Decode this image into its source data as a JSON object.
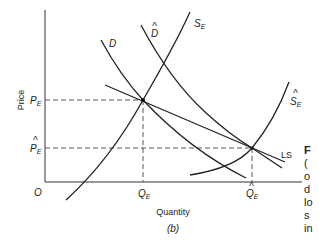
{
  "diagram": {
    "axes": {
      "ylabel": "Price",
      "xlabel": "Quantity",
      "origin": "O",
      "caption": "(b)"
    },
    "price_ticks": [
      {
        "label": "P",
        "sub": "E",
        "hat": false
      },
      {
        "label": "P",
        "sub": "E",
        "hat": true
      }
    ],
    "quantity_ticks": [
      {
        "label": "Q",
        "sub": "E",
        "hat": false
      },
      {
        "label": "Q",
        "sub": "E",
        "hat": true
      }
    ],
    "curves": {
      "demand": "D",
      "demand_shifted": "D",
      "supply": "S",
      "supply_sub": "E",
      "supply_shifted": "S",
      "supply_shifted_sub": "E",
      "long_run_supply": "LS"
    },
    "hat_glyph": "^",
    "side_text_fragments": [
      "F",
      "(",
      "o",
      "d",
      "lo",
      "s",
      "in"
    ]
  }
}
